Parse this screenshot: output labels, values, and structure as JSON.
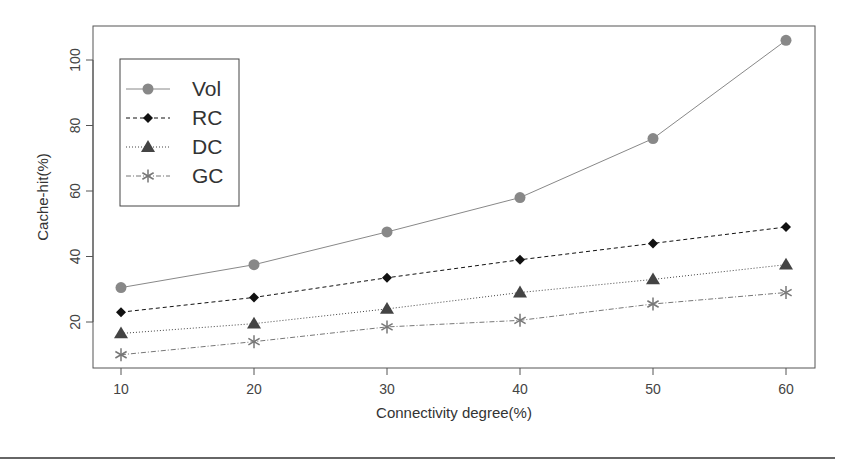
{
  "chart_data": {
    "type": "line",
    "title": "",
    "xlabel": "Connectivity degree(%)",
    "ylabel": "Cache-hit(%)",
    "x": [
      10,
      20,
      30,
      40,
      50,
      60
    ],
    "xticks": [
      "10",
      "20",
      "30",
      "40",
      "50",
      "60"
    ],
    "yticks": [
      "20",
      "40",
      "60",
      "80",
      "100"
    ],
    "xlim": [
      8,
      62
    ],
    "ylim": [
      6,
      107
    ],
    "grid": false,
    "legend_position": "top-left",
    "series": [
      {
        "name": "Vol",
        "values": [
          30.5,
          37.5,
          47.5,
          58,
          76,
          106
        ],
        "marker": "circle",
        "line": "solid",
        "color": "#888888"
      },
      {
        "name": "RC",
        "values": [
          23,
          27.5,
          33.5,
          39,
          44,
          49
        ],
        "marker": "diamond",
        "line": "dashed",
        "color": "#111111"
      },
      {
        "name": "DC",
        "values": [
          16.5,
          19.5,
          24,
          29,
          33,
          37.5
        ],
        "marker": "triangle",
        "line": "dotted",
        "color": "#444444"
      },
      {
        "name": "GC",
        "values": [
          10,
          14,
          18.5,
          20.5,
          25.5,
          29
        ],
        "marker": "asterisk",
        "line": "dotdash",
        "color": "#777777"
      }
    ]
  }
}
